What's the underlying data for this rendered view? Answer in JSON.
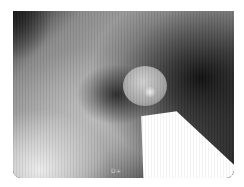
{
  "image": {
    "description": "Grayscale endoscopic view with spherical probe tip and bright light beam",
    "overlay_label": "D+"
  },
  "colors": {
    "background": "#ffffff",
    "frame_dark": "#1a1a1a",
    "tissue_gray": "#a5a5a5",
    "beam_white": "#ffffff"
  }
}
